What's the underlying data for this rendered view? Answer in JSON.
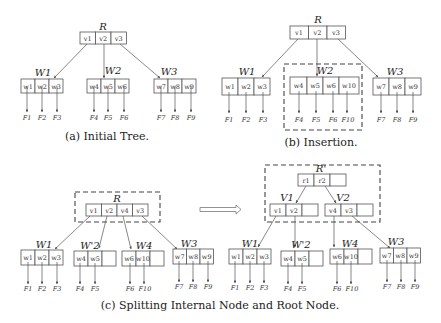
{
  "figure": {
    "panel_a": {
      "caption": "(a) Initial Tree.",
      "root": {
        "label": "R",
        "cells": [
          "v1",
          "v2",
          "v3"
        ]
      },
      "leaves": [
        {
          "label": "W1",
          "cells": [
            "w1",
            "w2",
            "w3"
          ],
          "pointers": [
            "F1",
            "F2",
            "F3"
          ]
        },
        {
          "label": "W2",
          "cells": [
            "w4",
            "w5",
            "w6"
          ],
          "pointers": [
            "F4",
            "F5",
            "F6"
          ]
        },
        {
          "label": "W3",
          "cells": [
            "w7",
            "w8",
            "w9"
          ],
          "pointers": [
            "F7",
            "F8",
            "F9"
          ]
        }
      ]
    },
    "panel_b": {
      "caption": "(b) Insertion.",
      "root": {
        "label": "R",
        "cells": [
          "v1",
          "v2",
          "v3"
        ]
      },
      "leaves": [
        {
          "label": "W1",
          "cells": [
            "w1",
            "w2",
            "w3"
          ],
          "pointers": [
            "F1",
            "F2",
            "F3"
          ]
        },
        {
          "label": "W2",
          "cells": [
            "w4",
            "w5",
            "w6",
            "w10"
          ],
          "pointers": [
            "F4",
            "F5",
            "F6",
            "F10"
          ],
          "highlighted": true
        },
        {
          "label": "W3",
          "cells": [
            "w7",
            "w8",
            "w9"
          ],
          "pointers": [
            "F7",
            "F8",
            "F9"
          ]
        }
      ]
    },
    "panel_c": {
      "caption": "(c) Splitting Internal Node and Root Node.",
      "before": {
        "root": {
          "label": "R",
          "cells": [
            "v1",
            "v2",
            "v4",
            "v3"
          ],
          "highlighted": true
        },
        "leaves": [
          {
            "label": "W1",
            "cells": [
              "w1",
              "w2",
              "w3"
            ],
            "pointers": [
              "F1",
              "F2",
              "F3"
            ]
          },
          {
            "label": "W'2",
            "cells": [
              "w4",
              "w5",
              ""
            ],
            "pointers": [
              "F4",
              "F5"
            ]
          },
          {
            "label": "W4",
            "cells": [
              "w6",
              "w10",
              ""
            ],
            "pointers": [
              "F6",
              "F10"
            ]
          },
          {
            "label": "W3",
            "cells": [
              "w7",
              "w8",
              "w9"
            ],
            "pointers": [
              "F7",
              "F8",
              "F9"
            ]
          }
        ]
      },
      "after": {
        "root": {
          "label": "R'",
          "cells": [
            "r1",
            "r2",
            ""
          ]
        },
        "internal": [
          {
            "label": "V1",
            "cells": [
              "v1",
              "v2",
              ""
            ]
          },
          {
            "label": "V2",
            "cells": [
              "v4",
              "v3",
              ""
            ]
          }
        ],
        "leaves": [
          {
            "label": "W1",
            "cells": [
              "w1",
              "w2",
              "w3"
            ],
            "pointers": [
              "F1",
              "F2",
              "F3"
            ]
          },
          {
            "label": "W'2",
            "cells": [
              "w4",
              "w5",
              ""
            ],
            "pointers": [
              "F4",
              "F5"
            ]
          },
          {
            "label": "W4",
            "cells": [
              "w6",
              "w10",
              ""
            ],
            "pointers": [
              "F6",
              "F10"
            ]
          },
          {
            "label": "W3",
            "cells": [
              "w7",
              "w8",
              "w9"
            ],
            "pointers": [
              "F7",
              "F8",
              "F9"
            ]
          }
        ]
      }
    }
  }
}
